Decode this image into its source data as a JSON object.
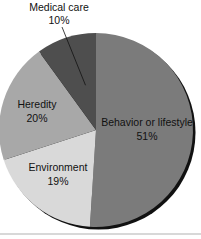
{
  "chart_data": {
    "type": "pie",
    "title": "",
    "slices": [
      {
        "label": "Behavior or lifestyle",
        "value": 51,
        "display": "51%",
        "color": "#7b7b7b"
      },
      {
        "label": "Environment",
        "value": 19,
        "display": "19%",
        "color": "#d9d9d9"
      },
      {
        "label": "Heredity",
        "value": 20,
        "display": "20%",
        "color": "#a8a8a8"
      },
      {
        "label": "Medical care",
        "value": 10,
        "display": "10%",
        "color": "#4e4e4e"
      }
    ],
    "start": "12 o'clock",
    "direction": "clockwise",
    "legend": "none (labels on slices)"
  }
}
